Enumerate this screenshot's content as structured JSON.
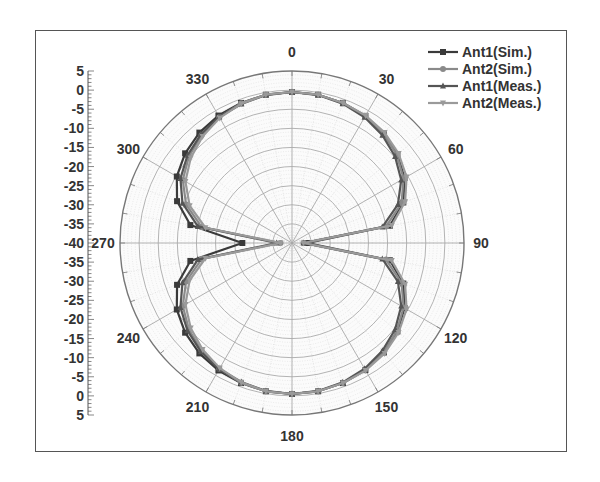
{
  "chart_data": {
    "type": "polar",
    "title": "",
    "radial_axis": {
      "min": -40,
      "max": 5,
      "step": 5,
      "tick_labels": [
        "5",
        "0",
        "-5",
        "-10",
        "-15",
        "-20",
        "-25",
        "-30",
        "-35",
        "-40",
        "-35",
        "-30",
        "-25",
        "-20",
        "-15",
        "-10",
        "-5",
        "0",
        "5"
      ]
    },
    "angular_axis": {
      "labels": [
        "0",
        "30",
        "60",
        "90",
        "120",
        "150",
        "180",
        "210",
        "240",
        "270",
        "300",
        "330"
      ],
      "direction": "clockwise",
      "zero_location": "top"
    },
    "legend": {
      "position": "top-right",
      "entries": [
        "Ant1(Sim.)",
        "Ant2(Sim.)",
        "Ant1(Meas.)",
        "Ant2(Meas.)"
      ]
    },
    "angles": [
      0,
      10,
      20,
      30,
      40,
      50,
      60,
      70,
      80,
      90,
      100,
      110,
      120,
      130,
      140,
      150,
      160,
      170,
      180,
      190,
      200,
      210,
      220,
      230,
      240,
      250,
      260,
      270,
      280,
      290,
      300,
      310,
      320,
      330,
      340,
      350
    ],
    "series": [
      {
        "name": "Ant1(Sim.)",
        "color": "#3a3a3a",
        "marker": "square",
        "values": [
          -0.5,
          -0.6,
          -1.0,
          -1.6,
          -2.6,
          -4.0,
          -6.0,
          -9.0,
          -14.0,
          -36.0,
          -14.0,
          -9.0,
          -6.0,
          -4.0,
          -2.6,
          -1.6,
          -1.0,
          -0.6,
          -0.5,
          -0.6,
          -1.0,
          -1.5,
          -2.3,
          -3.5,
          -5.2,
          -8.0,
          -13.0,
          -27.0,
          -13.0,
          -8.0,
          -5.2,
          -3.5,
          -2.3,
          -1.5,
          -1.0,
          -0.6
        ]
      },
      {
        "name": "Ant2(Sim.)",
        "color": "#8a8a8a",
        "marker": "circle",
        "values": [
          -0.5,
          -0.6,
          -1.0,
          -1.7,
          -2.7,
          -4.2,
          -6.3,
          -9.5,
          -15.0,
          -37.0,
          -15.0,
          -9.5,
          -6.3,
          -4.2,
          -2.7,
          -1.7,
          -1.0,
          -0.6,
          -0.5,
          -0.6,
          -1.1,
          -2.0,
          -3.2,
          -4.8,
          -7.0,
          -10.5,
          -16.0,
          -37.0,
          -16.0,
          -10.5,
          -7.0,
          -4.8,
          -3.2,
          -2.0,
          -1.1,
          -0.6
        ]
      },
      {
        "name": "Ant1(Meas.)",
        "color": "#555555",
        "marker": "triangle-up",
        "values": [
          -0.5,
          -0.7,
          -1.2,
          -2.0,
          -3.2,
          -4.8,
          -7.0,
          -10.5,
          -16.0,
          -37.0,
          -16.0,
          -10.5,
          -7.0,
          -4.8,
          -3.2,
          -2.0,
          -1.2,
          -0.7,
          -0.5,
          -0.7,
          -1.3,
          -1.9,
          -2.9,
          -4.3,
          -6.3,
          -9.5,
          -15.0,
          -36.0,
          -15.0,
          -9.5,
          -6.3,
          -4.3,
          -2.9,
          -1.9,
          -1.3,
          -0.7
        ]
      },
      {
        "name": "Ant2(Meas.)",
        "color": "#9a9a9a",
        "marker": "triangle-down",
        "values": [
          -0.5,
          -0.6,
          -1.0,
          -1.5,
          -2.3,
          -3.6,
          -5.4,
          -8.5,
          -13.5,
          -37.0,
          -13.5,
          -8.5,
          -5.4,
          -3.6,
          -2.3,
          -1.5,
          -1.0,
          -0.6,
          -0.5,
          -0.6,
          -1.2,
          -2.2,
          -3.6,
          -5.4,
          -7.8,
          -11.5,
          -17.0,
          -37.0,
          -17.0,
          -11.5,
          -7.8,
          -5.4,
          -3.6,
          -2.2,
          -1.2,
          -0.6
        ]
      }
    ],
    "grid": true
  },
  "layout": {
    "center": [
      292,
      243
    ],
    "radius": 172,
    "scale_x": 88,
    "scale_top": 71,
    "scale_bottom": 415
  }
}
